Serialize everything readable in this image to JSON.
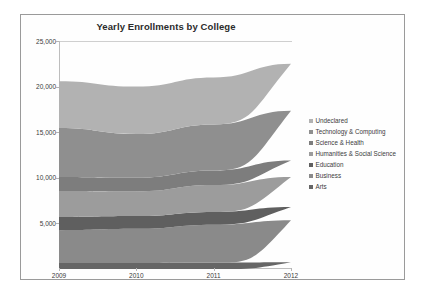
{
  "figure": {
    "title": "Yearly Enrollments by College",
    "border_color": "#9a9a9a",
    "background": "#fefefe"
  },
  "axes": {
    "y_ticks": [
      "25,000",
      "20,000",
      "15,000",
      "10,000",
      "5,000"
    ],
    "y_tick_values": [
      25000,
      20000,
      15000,
      10000,
      5000
    ],
    "x_ticks": [
      "2009",
      "2010",
      "2011",
      "2012"
    ]
  },
  "legend": {
    "position": "right",
    "items": [
      {
        "label": "Undeclared",
        "color": "#b2b2b2"
      },
      {
        "label": "Technology & Computing",
        "color": "#8f8f8f"
      },
      {
        "label": "Science & Health",
        "color": "#7d7d7d"
      },
      {
        "label": "Humanities & Social Science",
        "color": "#9c9c9c"
      },
      {
        "label": "Education",
        "color": "#5f5f5f"
      },
      {
        "label": "Business",
        "color": "#8a8a8a"
      },
      {
        "label": "Arts",
        "color": "#666666"
      }
    ]
  },
  "chart_data": {
    "type": "area",
    "stacked": true,
    "title": "Yearly Enrollments by College",
    "xlabel": "",
    "ylabel": "",
    "x": [
      2009,
      2010,
      2011,
      2012
    ],
    "categories": [
      "2009",
      "2010",
      "2011",
      "2012"
    ],
    "ylim": [
      0,
      25000
    ],
    "xlim": [
      2009,
      2012
    ],
    "grid": false,
    "legend_position": "right",
    "stack_order_bottom_to_top": [
      "Arts",
      "Business",
      "Education",
      "Humanities & Social Science",
      "Science & Health",
      "Technology & Computing",
      "Undeclared"
    ],
    "series": [
      {
        "name": "Arts",
        "color": "#666666",
        "values": [
          650,
          650,
          700,
          750
        ]
      },
      {
        "name": "Business",
        "color": "#8a8a8a",
        "values": [
          3600,
          3750,
          4150,
          4600
        ]
      },
      {
        "name": "Education",
        "color": "#5f5f5f",
        "values": [
          1450,
          1400,
          1400,
          1450
        ]
      },
      {
        "name": "Humanities & Social Science",
        "color": "#9c9c9c",
        "values": [
          2850,
          2700,
          2950,
          3300
        ]
      },
      {
        "name": "Science & Health",
        "color": "#7d7d7d",
        "values": [
          1550,
          1500,
          1600,
          1800
        ]
      },
      {
        "name": "Technology & Computing",
        "color": "#8f8f8f",
        "values": [
          5350,
          4800,
          5050,
          5450
        ]
      },
      {
        "name": "Undeclared",
        "color": "#b2b2b2",
        "values": [
          5150,
          5200,
          5150,
          5150
        ]
      }
    ],
    "cumulative_tops": {
      "Arts": [
        650,
        650,
        700,
        750
      ],
      "Business": [
        4250,
        4400,
        4850,
        5350
      ],
      "Education": [
        5700,
        5800,
        6250,
        6800
      ],
      "Humanities & Social Science": [
        8550,
        8500,
        9200,
        10100
      ],
      "Science & Health": [
        10100,
        10000,
        10800,
        11900
      ],
      "Technology & Computing": [
        15450,
        14800,
        15850,
        17350
      ],
      "Undeclared": [
        20600,
        20000,
        21000,
        22500
      ]
    },
    "totals": [
      20600,
      20000,
      21000,
      22500
    ]
  }
}
